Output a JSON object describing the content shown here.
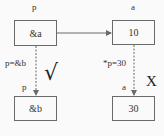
{
  "diagram": {
    "top_left": {
      "var_label": "p",
      "value": "&a"
    },
    "top_right": {
      "var_label": "a",
      "value": "10"
    },
    "bottom_left": {
      "var_label": "p",
      "value": "&b"
    },
    "bottom_right": {
      "var_label": "a",
      "value": "30"
    },
    "left_edge_label": "p=&b",
    "right_edge_label": "*p=30",
    "left_mark": "√",
    "right_mark": "X",
    "colors": {
      "line": "#6a6a6a",
      "text": "#333333",
      "background": "#fafafa"
    }
  }
}
